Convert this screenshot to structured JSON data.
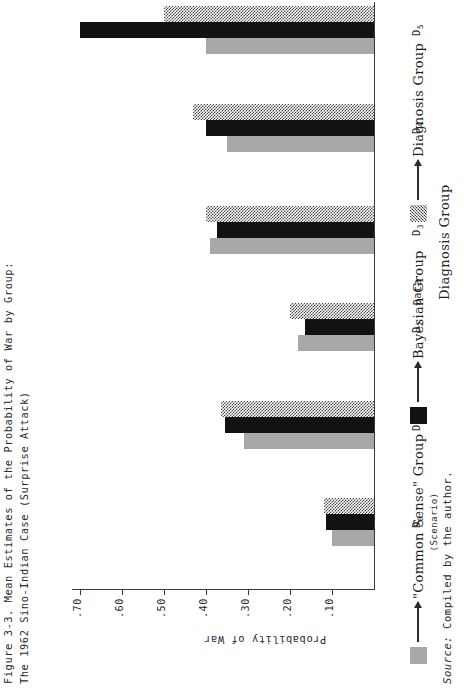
{
  "figure": {
    "title_line_1": "Figure 3-3.  Mean Estimates of the Probability of War by Group:",
    "title_line_2": "The 1962 Sino-Indian Case (Surprise Attack)",
    "source_prefix": "Source:",
    "source_text": " Compiled by the author."
  },
  "annotations": {
    "data_label": "Data"
  },
  "legend": {
    "entries": [
      {
        "label": "\"Common Sense\" Group",
        "swatch": "light-grey-fill",
        "color": "#a8a8a8"
      },
      {
        "label": "Bayesian Group",
        "swatch": "solid-black-fill",
        "color": "#121212"
      },
      {
        "label": "Diagnosis Group",
        "swatch": "checkerboard-fill",
        "color": "#4a4a4a"
      }
    ]
  },
  "chart_data": {
    "type": "bar",
    "orientation": "vertical-grouped",
    "title": "Figure 3-3.  Mean Estimates of the Probability of War by Group: The 1962 Sino-Indian Case (Surprise Attack)",
    "xlabel": "Diagnosis Group",
    "ylabel": "Probability of War",
    "categories": [
      "D0",
      "D1",
      "D2",
      "D3",
      "D4",
      "D5"
    ],
    "category_labels": [
      "D",
      "D",
      "D",
      "D",
      "D",
      "D"
    ],
    "category_subscripts": [
      "0",
      "1",
      "2",
      "3",
      "4",
      "5"
    ],
    "category_notes": [
      "(Scenario)",
      "",
      "",
      "",
      "",
      ""
    ],
    "ylim": [
      0,
      0.75
    ],
    "yticks": [
      0.1,
      0.2,
      0.3,
      0.4,
      0.5,
      0.6,
      0.7
    ],
    "ytick_labels": [
      ".10",
      ".20",
      ".30",
      ".40",
      ".50",
      ".60",
      ".70"
    ],
    "grid": false,
    "legend_position": "below-right",
    "series": [
      {
        "name": "\"Common Sense\" Group",
        "color": "#a8a8a8",
        "values": [
          0.1,
          0.31,
          0.18,
          0.39,
          0.35,
          0.4
        ]
      },
      {
        "name": "Bayesian Group",
        "color": "#121212",
        "values": [
          0.115,
          0.355,
          0.165,
          0.375,
          0.4,
          0.7
        ]
      },
      {
        "name": "Diagnosis Group",
        "color": "#4a4a4a",
        "values": [
          0.12,
          0.365,
          0.2,
          0.4,
          0.43,
          0.5
        ]
      }
    ]
  }
}
